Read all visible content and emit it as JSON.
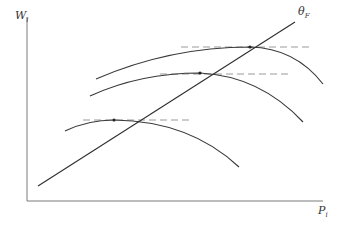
{
  "diagram": {
    "type": "economics-curve-diagram",
    "axes": {
      "y_label": "W",
      "y_label_sub": "i",
      "x_label": "P",
      "x_label_sub": "i"
    },
    "line_label": "θ",
    "line_label_sub": "F",
    "colors": {
      "axis": "#7a7a7a",
      "curve": "#3a3a3a",
      "line": "#2e2e2e",
      "dash": "#9a9a9a",
      "background": "#ffffff"
    },
    "curves": [
      {
        "name": "curve-high",
        "start": [
          96,
          79
        ],
        "peak": [
          250,
          47
        ],
        "end": [
          323,
          84
        ]
      },
      {
        "name": "curve-mid",
        "start": [
          90,
          96
        ],
        "peak": [
          200,
          73
        ],
        "end": [
          303,
          122
        ]
      },
      {
        "name": "curve-low",
        "start": [
          65,
          131
        ],
        "peak": [
          114,
          120
        ],
        "end": [
          239,
          167
        ]
      }
    ],
    "tangents": [
      {
        "y": 47,
        "x1": 181,
        "x2": 312
      },
      {
        "y": 74,
        "x1": 160,
        "x2": 292
      },
      {
        "y": 120,
        "x1": 83,
        "x2": 192
      }
    ],
    "theta_line": {
      "x1": 38,
      "y1": 186,
      "x2": 295,
      "y2": 22
    }
  }
}
